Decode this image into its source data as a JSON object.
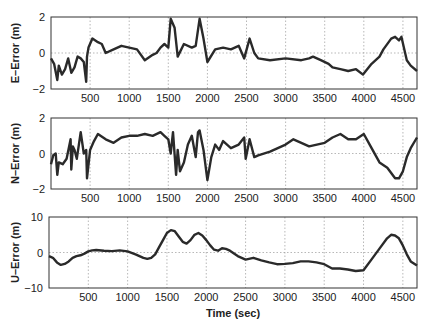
{
  "chart_data": [
    {
      "type": "line",
      "title": "",
      "xlabel": "",
      "ylabel": "E-Error (m)",
      "xlim": [
        0,
        4680
      ],
      "ylim": [
        -2,
        2
      ],
      "xticks": [
        500,
        1000,
        1500,
        2000,
        2500,
        3000,
        3500,
        4000,
        4500
      ],
      "yticks": [
        -2,
        0,
        2
      ],
      "grid": true,
      "series": [
        {
          "name": "E-Error",
          "x": [
            0,
            40,
            80,
            100,
            140,
            180,
            220,
            260,
            300,
            340,
            380,
            420,
            450,
            460,
            480,
            530,
            600,
            650,
            700,
            800,
            900,
            1000,
            1100,
            1200,
            1300,
            1350,
            1400,
            1450,
            1500,
            1530,
            1580,
            1620,
            1700,
            1800,
            1850,
            1900,
            1950,
            2000,
            2100,
            2200,
            2300,
            2400,
            2470,
            2540,
            2600,
            2650,
            2800,
            3000,
            3200,
            3300,
            3350,
            3450,
            3550,
            3600,
            3700,
            3800,
            3900,
            3990,
            4100,
            4200,
            4250,
            4350,
            4400,
            4450,
            4480,
            4550,
            4600,
            4680
          ],
          "values": [
            -0.3,
            -0.6,
            -1.5,
            -0.7,
            -1.2,
            -0.9,
            -0.3,
            -1.1,
            -0.8,
            -0.2,
            -0.3,
            -0.5,
            -1.6,
            -0.2,
            0.3,
            0.8,
            0.6,
            0.5,
            0.0,
            0.2,
            0.4,
            0.3,
            0.2,
            -0.4,
            -0.1,
            0.0,
            0.3,
            0.5,
            0.3,
            1.9,
            1.4,
            -0.2,
            0.5,
            0.3,
            0.4,
            1.9,
            0.8,
            -0.5,
            0.2,
            0.3,
            0.2,
            0.4,
            -0.3,
            0.8,
            0.0,
            -0.3,
            -0.4,
            -0.3,
            -0.4,
            -0.3,
            -0.2,
            -0.4,
            -0.6,
            -0.8,
            -0.9,
            -1.0,
            -0.9,
            -1.2,
            -0.6,
            -0.2,
            0.2,
            0.8,
            0.9,
            0.7,
            0.9,
            -0.4,
            -0.7,
            -1.0
          ]
        }
      ]
    },
    {
      "type": "line",
      "title": "",
      "xlabel": "",
      "ylabel": "N-Error (m)",
      "xlim": [
        0,
        4680
      ],
      "ylim": [
        -2,
        2
      ],
      "xticks": [
        500,
        1000,
        1500,
        2000,
        2500,
        3000,
        3500,
        4000,
        4500
      ],
      "yticks": [
        -2,
        0,
        2
      ],
      "grid": true,
      "series": [
        {
          "name": "N-Error",
          "x": [
            0,
            30,
            60,
            80,
            100,
            150,
            200,
            250,
            260,
            280,
            300,
            330,
            380,
            420,
            450,
            460,
            500,
            550,
            600,
            700,
            800,
            900,
            1000,
            1100,
            1200,
            1300,
            1400,
            1450,
            1500,
            1530,
            1560,
            1600,
            1620,
            1650,
            1700,
            1750,
            1800,
            1850,
            1880,
            1900,
            1950,
            2000,
            2050,
            2100,
            2150,
            2200,
            2300,
            2400,
            2470,
            2490,
            2540,
            2600,
            2650,
            2800,
            3000,
            3100,
            3200,
            3300,
            3400,
            3500,
            3600,
            3700,
            3800,
            3900,
            4000,
            4100,
            4200,
            4300,
            4400,
            4450,
            4500,
            4550,
            4600,
            4680
          ],
          "values": [
            -0.6,
            -0.1,
            0.0,
            -1.2,
            -0.5,
            -0.6,
            -0.3,
            0.8,
            -0.9,
            0.4,
            0.2,
            -0.3,
            1.2,
            0.0,
            0.2,
            -1.4,
            0.2,
            0.7,
            1.1,
            0.8,
            0.6,
            0.9,
            1.0,
            1.0,
            1.1,
            1.0,
            1.2,
            1.0,
            0.8,
            0.0,
            1.2,
            -1.2,
            0.2,
            -1.0,
            -0.5,
            0.5,
            1.0,
            -0.2,
            1.2,
            1.3,
            0.2,
            -1.5,
            -0.2,
            0.5,
            0.2,
            0.7,
            0.3,
            0.5,
            0.9,
            -0.3,
            0.8,
            -0.2,
            -0.1,
            0.1,
            0.5,
            0.8,
            0.6,
            0.4,
            0.5,
            0.6,
            0.9,
            1.1,
            0.8,
            0.8,
            1.1,
            0.3,
            -0.5,
            -0.8,
            -1.4,
            -1.4,
            -1.0,
            -0.2,
            0.3,
            0.9
          ]
        }
      ]
    },
    {
      "type": "line",
      "title": "",
      "xlabel": "Time (sec)",
      "ylabel": "U-Error (m)",
      "xlim": [
        0,
        4680
      ],
      "ylim": [
        -10,
        10
      ],
      "xticks": [
        500,
        1000,
        1500,
        2000,
        2500,
        3000,
        3500,
        4000,
        4500
      ],
      "yticks": [
        -10,
        0,
        10
      ],
      "grid": true,
      "series": [
        {
          "name": "U-Error",
          "x": [
            0,
            50,
            100,
            150,
            200,
            250,
            300,
            350,
            400,
            450,
            500,
            550,
            600,
            700,
            800,
            900,
            1000,
            1100,
            1200,
            1250,
            1300,
            1350,
            1400,
            1450,
            1500,
            1550,
            1600,
            1650,
            1700,
            1750,
            1800,
            1850,
            1900,
            1950,
            2000,
            2050,
            2100,
            2150,
            2200,
            2250,
            2300,
            2400,
            2500,
            2600,
            2700,
            2800,
            2900,
            3000,
            3100,
            3200,
            3300,
            3400,
            3500,
            3600,
            3700,
            3800,
            3900,
            4000,
            4100,
            4200,
            4300,
            4350,
            4400,
            4450,
            4500,
            4550,
            4600,
            4680
          ],
          "values": [
            -1.0,
            -1.5,
            -2.8,
            -3.5,
            -3.2,
            -2.5,
            -1.5,
            -1.0,
            -0.8,
            -0.3,
            0.3,
            0.6,
            0.7,
            0.5,
            0.4,
            0.6,
            0.3,
            -0.5,
            -1.5,
            -1.8,
            -1.5,
            -0.5,
            1.5,
            3.5,
            5.5,
            6.3,
            6.0,
            4.5,
            3.0,
            2.5,
            3.5,
            5.0,
            5.5,
            4.8,
            3.5,
            2.0,
            0.8,
            0.5,
            1.2,
            1.0,
            0.5,
            -1.0,
            -2.0,
            -1.5,
            -2.2,
            -2.8,
            -3.3,
            -3.2,
            -3.0,
            -2.5,
            -2.5,
            -2.8,
            -3.3,
            -4.5,
            -4.5,
            -4.8,
            -5.2,
            -5.0,
            -2.0,
            1.0,
            4.0,
            5.0,
            4.8,
            4.0,
            2.0,
            -0.5,
            -2.5,
            -3.7
          ]
        }
      ]
    }
  ],
  "labels": {
    "panel1_ylabel": "E–Error (m)",
    "panel2_ylabel": "N–Error (m)",
    "panel3_ylabel": "U–Error (m)",
    "xlabel": "Time (sec)",
    "xticks": [
      "500",
      "1000",
      "1500",
      "2000",
      "2500",
      "3000",
      "3500",
      "4000",
      "4500"
    ],
    "panel1_yticks": [
      "2",
      "0",
      "−2"
    ],
    "panel2_yticks": [
      "2",
      "0",
      "−2"
    ],
    "panel3_yticks": [
      "10",
      "0",
      "−10"
    ]
  },
  "style": {
    "line_color": "#2a2a2a",
    "grid_color": "#9a9a9a",
    "axis_color": "#333333"
  }
}
